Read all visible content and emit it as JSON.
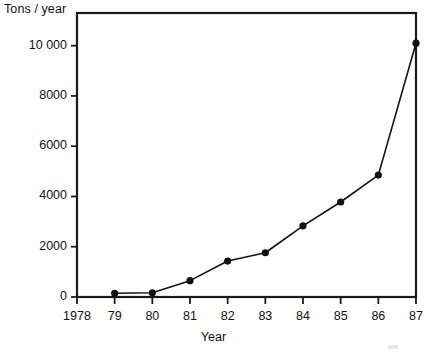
{
  "chart_data": {
    "type": "line",
    "title": "",
    "ylabel": "Tons / year",
    "xlabel": "Year",
    "categories": [
      "1978",
      "79",
      "80",
      "81",
      "82",
      "83",
      "84",
      "85",
      "86",
      "87"
    ],
    "x": [
      1978,
      1979,
      1980,
      1981,
      1982,
      1983,
      1984,
      1985,
      1986,
      1987
    ],
    "values": [
      null,
      150,
      170,
      650,
      1430,
      1760,
      2830,
      3780,
      4850,
      10100
    ],
    "series": [
      {
        "name": "Tons / year",
        "values": [
          null,
          150,
          170,
          650,
          1430,
          1760,
          2830,
          3780,
          4850,
          10100
        ]
      }
    ],
    "ytick_labels": [
      "0",
      "2000",
      "4000",
      "6000",
      "8000",
      "10 000"
    ],
    "ytick_values": [
      0,
      2000,
      4000,
      6000,
      8000,
      10000
    ],
    "ylim": [
      0,
      11300
    ],
    "xlim": [
      1978,
      1987
    ],
    "grid": false,
    "legend": false,
    "marker": "filled-circle",
    "line_color": "#111111",
    "marker_color": "#111111",
    "frame_color": "#1a1a1a",
    "background": "#ffffff"
  },
  "axes": {
    "y_title": "Tons / year",
    "x_title": "Year"
  }
}
